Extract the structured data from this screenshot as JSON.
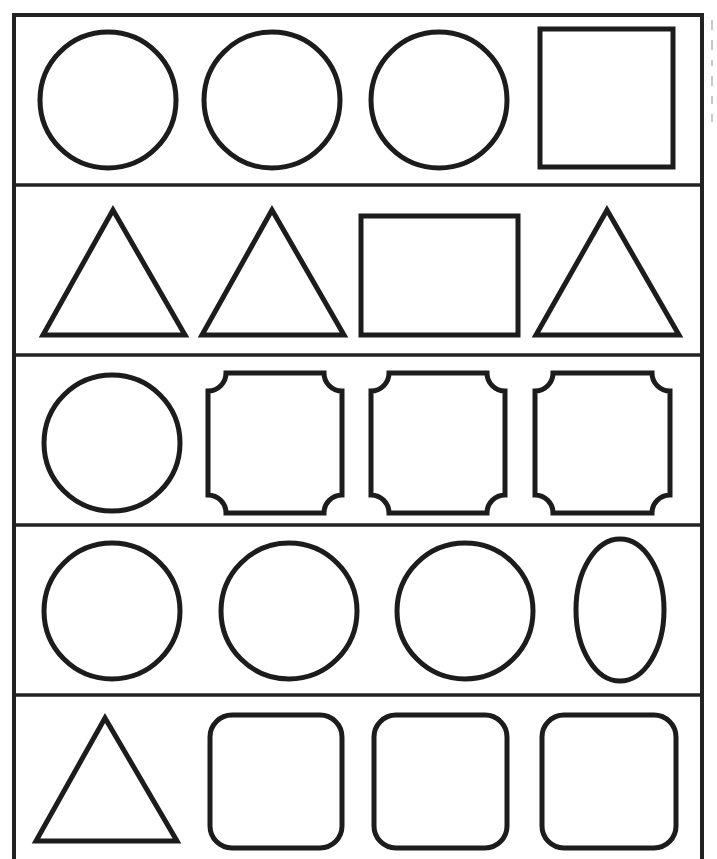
{
  "worksheet": {
    "title": "Odd one out shapes",
    "colors": {
      "stroke": "#1c1c1c",
      "frame": "#222222",
      "background": "#ffffff"
    },
    "frame": {
      "x": 14,
      "y": 15,
      "width": 688,
      "bottom_cut": true
    },
    "row_dividers_y": [
      185,
      355,
      525,
      695
    ],
    "rows": [
      {
        "index": 1,
        "shapes": [
          {
            "type": "circle",
            "cx": 108,
            "cy": 100,
            "r": 68
          },
          {
            "type": "circle",
            "cx": 272,
            "cy": 100,
            "r": 68
          },
          {
            "type": "circle",
            "cx": 439,
            "cy": 100,
            "r": 68
          },
          {
            "type": "square",
            "x": 540,
            "y": 29,
            "w": 133,
            "h": 138
          }
        ]
      },
      {
        "index": 2,
        "shapes": [
          {
            "type": "triangle",
            "points": "113,210 43,335 185,335"
          },
          {
            "type": "triangle",
            "points": "272,210 202,335 344,335"
          },
          {
            "type": "rectangle",
            "x": 361,
            "y": 216,
            "w": 157,
            "h": 119
          },
          {
            "type": "triangle",
            "points": "607,210 536,335 679,335"
          }
        ]
      },
      {
        "index": 3,
        "shapes": [
          {
            "type": "circle",
            "cx": 112,
            "cy": 443,
            "r": 68
          },
          {
            "type": "ticket",
            "x": 208,
            "y": 373,
            "w": 134,
            "h": 140,
            "notch": 18
          },
          {
            "type": "ticket",
            "x": 371,
            "y": 373,
            "w": 134,
            "h": 140,
            "notch": 18
          },
          {
            "type": "ticket",
            "x": 535,
            "y": 373,
            "w": 135,
            "h": 140,
            "notch": 18
          }
        ]
      },
      {
        "index": 4,
        "shapes": [
          {
            "type": "circle",
            "cx": 112,
            "cy": 611,
            "r": 68
          },
          {
            "type": "circle",
            "cx": 289,
            "cy": 611,
            "r": 68
          },
          {
            "type": "circle",
            "cx": 465,
            "cy": 611,
            "r": 68
          },
          {
            "type": "ellipse",
            "cx": 620,
            "cy": 610,
            "rx": 44,
            "ry": 71
          }
        ]
      },
      {
        "index": 5,
        "shapes": [
          {
            "type": "triangle",
            "points": "105,718 36,841 177,841"
          },
          {
            "type": "rounded-square",
            "x": 210,
            "y": 715,
            "w": 132,
            "h": 133,
            "r": 22
          },
          {
            "type": "rounded-square",
            "x": 374,
            "y": 715,
            "w": 133,
            "h": 133,
            "r": 22
          },
          {
            "type": "rounded-square",
            "x": 542,
            "y": 715,
            "w": 134,
            "h": 133,
            "r": 22
          }
        ]
      }
    ]
  }
}
